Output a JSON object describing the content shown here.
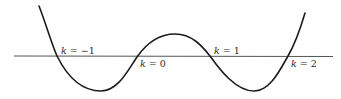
{
  "diagram": {
    "type": "function-graph",
    "colors": {
      "curve": "#1c1c1c",
      "axis": "#555555",
      "label": "#2a2a2a",
      "background": "#ffffff"
    },
    "axis": {
      "y": 56,
      "x_start": 14,
      "x_end": 333
    },
    "crossings": [
      {
        "id": "k-minus-1",
        "var": "k",
        "eq": " = ",
        "value": "−1",
        "x": 57
      },
      {
        "id": "k-0",
        "var": "k",
        "eq": " = ",
        "value": "0",
        "x": 137
      },
      {
        "id": "k-1",
        "var": "k",
        "eq": " = ",
        "value": "1",
        "x": 210
      },
      {
        "id": "k-2",
        "var": "k",
        "eq": " = ",
        "value": "2",
        "x": 288
      }
    ],
    "labels": [
      {
        "text_var": "k",
        "text_rest": " = −1",
        "left": 61,
        "top": 46
      },
      {
        "text_var": "k",
        "text_rest": " = 0",
        "left": 140,
        "top": 59
      },
      {
        "text_var": "k",
        "text_rest": " = 1",
        "left": 214,
        "top": 46
      },
      {
        "text_var": "k",
        "text_rest": " = 2",
        "left": 291,
        "top": 59
      }
    ]
  }
}
